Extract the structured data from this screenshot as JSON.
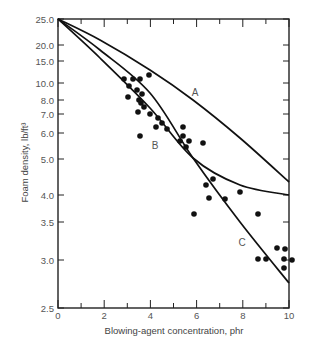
{
  "chart_data": {
    "type": "scatter",
    "title": "",
    "xlabel": "Blowing-agent concentration, phr",
    "ylabel": "Foam density, lb/ft³",
    "xlim": [
      0,
      10
    ],
    "ylim": [
      2.5,
      25.0
    ],
    "yscale": "nonlinear (log-like)",
    "grid": false,
    "legend": "none (curves labeled inline A, B, C)",
    "x_ticks": [
      {
        "label": "0",
        "value": 0
      },
      {
        "label": "2",
        "value": 2
      },
      {
        "label": "4",
        "value": 4
      },
      {
        "label": "6",
        "value": 6
      },
      {
        "label": "8",
        "value": 8
      },
      {
        "label": "10",
        "value": 10
      }
    ],
    "y_ticks": [
      {
        "label": "25.0",
        "py": 19
      },
      {
        "label": "20.0",
        "py": 45
      },
      {
        "label": "15.0",
        "py": 61
      },
      {
        "label": "10.0",
        "py": 83
      },
      {
        "label": "8.0",
        "py": 100
      },
      {
        "label": "7.0",
        "py": 114
      },
      {
        "label": "6.0",
        "py": 133
      },
      {
        "label": "5.0",
        "py": 159
      },
      {
        "label": "4.0",
        "py": 195
      },
      {
        "label": "3.5",
        "py": 222
      },
      {
        "label": "3.0",
        "py": 260
      },
      {
        "label": "2.5",
        "py": 308
      }
    ],
    "series": [
      {
        "name": "Experimental data",
        "kind": "scatter",
        "points_px": [
          [
            124,
            79
          ],
          [
            133,
            79
          ],
          [
            140,
            79
          ],
          [
            149,
            75
          ],
          [
            129,
            86
          ],
          [
            137,
            90
          ],
          [
            128,
            97
          ],
          [
            142,
            94
          ],
          [
            139,
            100
          ],
          [
            141,
            103
          ],
          [
            144,
            107
          ],
          [
            138,
            112
          ],
          [
            150,
            114
          ],
          [
            158,
            118
          ],
          [
            162,
            123
          ],
          [
            156,
            127
          ],
          [
            167,
            129
          ],
          [
            183,
            127
          ],
          [
            183,
            136
          ],
          [
            180,
            141
          ],
          [
            189,
            141
          ],
          [
            186,
            147
          ],
          [
            203,
            143
          ],
          [
            140,
            136
          ],
          [
            194,
            214
          ],
          [
            213,
            179
          ],
          [
            206,
            185
          ],
          [
            209,
            198
          ],
          [
            240,
            192
          ],
          [
            225,
            199
          ],
          [
            258,
            214
          ],
          [
            258,
            259
          ],
          [
            266,
            259
          ],
          [
            277,
            248
          ],
          [
            285,
            249
          ],
          [
            284,
            259
          ],
          [
            292,
            260
          ],
          [
            284,
            268
          ]
        ],
        "approx_values": [
          [
            2.9,
            10.0
          ],
          [
            3.2,
            10.0
          ],
          [
            3.5,
            10.0
          ],
          [
            3.9,
            10.3
          ],
          [
            3.1,
            9.3
          ],
          [
            3.4,
            9.0
          ],
          [
            3.0,
            8.6
          ],
          [
            3.6,
            8.8
          ],
          [
            3.5,
            8.0
          ],
          [
            3.6,
            7.8
          ],
          [
            3.7,
            7.5
          ],
          [
            3.5,
            7.1
          ],
          [
            4.0,
            6.9
          ],
          [
            4.3,
            6.6
          ],
          [
            4.5,
            6.3
          ],
          [
            4.2,
            6.1
          ],
          [
            4.7,
            6.0
          ],
          [
            5.4,
            6.1
          ],
          [
            5.4,
            5.7
          ],
          [
            5.3,
            5.5
          ],
          [
            5.7,
            5.5
          ],
          [
            5.5,
            5.3
          ],
          [
            6.3,
            5.4
          ],
          [
            3.5,
            5.9
          ],
          [
            5.9,
            3.8
          ],
          [
            6.7,
            4.3
          ],
          [
            6.4,
            4.2
          ],
          [
            6.5,
            4.0
          ],
          [
            7.9,
            4.1
          ],
          [
            7.2,
            4.0
          ],
          [
            8.7,
            3.8
          ],
          [
            8.7,
            3.0
          ],
          [
            9.0,
            3.0
          ],
          [
            9.5,
            3.1
          ],
          [
            9.8,
            3.1
          ],
          [
            9.8,
            3.0
          ],
          [
            10.1,
            3.0
          ],
          [
            9.8,
            2.9
          ]
        ]
      },
      {
        "name": "A",
        "kind": "line",
        "label_pos_px": [
          195,
          92
        ],
        "path_px": [
          [
            58,
            19
          ],
          [
            100,
            40
          ],
          [
            150,
            70
          ],
          [
            193,
            100
          ],
          [
            240,
            138
          ],
          [
            289,
            182
          ]
        ],
        "approx_values": [
          [
            0,
            25.0
          ],
          [
            2,
            19.0
          ],
          [
            4,
            12.0
          ],
          [
            6,
            9.0
          ],
          [
            8,
            6.0
          ],
          [
            10,
            4.2
          ]
        ]
      },
      {
        "name": "B",
        "kind": "line",
        "label_pos_px": [
          155,
          145
        ],
        "path_px": [
          [
            58,
            19
          ],
          [
            100,
            58
          ],
          [
            150,
            108
          ],
          [
            193,
            158
          ],
          [
            240,
            185
          ],
          [
            289,
            195
          ]
        ],
        "approx_values": [
          [
            0,
            25.0
          ],
          [
            2,
            14.0
          ],
          [
            4,
            7.5
          ],
          [
            6,
            5.0
          ],
          [
            8,
            4.3
          ],
          [
            10,
            4.0
          ]
        ]
      },
      {
        "name": "C",
        "kind": "line",
        "label_pos_px": [
          242,
          242
        ],
        "path_px": [
          [
            58,
            19
          ],
          [
            100,
            50
          ],
          [
            150,
            93
          ],
          [
            193,
            158
          ],
          [
            240,
            222
          ],
          [
            289,
            283
          ]
        ],
        "approx_values": [
          [
            0,
            25.0
          ],
          [
            2,
            17.0
          ],
          [
            4,
            9.5
          ],
          [
            6,
            5.0
          ],
          [
            8,
            3.5
          ],
          [
            10,
            2.7
          ]
        ]
      }
    ]
  }
}
